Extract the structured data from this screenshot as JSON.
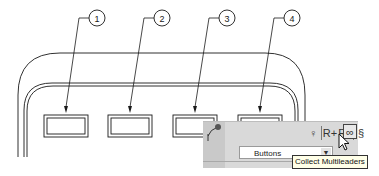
{
  "balloons": [
    {
      "label": "1",
      "cx": 97,
      "cy": 18,
      "leader_to": [
        66,
        113
      ]
    },
    {
      "label": "2",
      "cx": 162,
      "cy": 18,
      "leader_to": [
        130,
        113
      ]
    },
    {
      "label": "3",
      "cx": 227,
      "cy": 18,
      "leader_to": [
        195,
        113
      ]
    },
    {
      "label": "4",
      "cx": 292,
      "cy": 18,
      "leader_to": [
        260,
        113
      ]
    }
  ],
  "toolbar": {
    "tools": [
      {
        "name": "add-leader-tool",
        "glyph": "♀"
      },
      {
        "name": "add-leader-plus-tool",
        "glyph": "R+"
      },
      {
        "name": "remove-leader-tool",
        "glyph": "Rx"
      },
      {
        "name": "align-multileaders-tool",
        "glyph": "§"
      },
      {
        "name": "collect-multileaders-tool",
        "glyph": "∞"
      }
    ],
    "style_combo": {
      "value": "Buttons"
    },
    "tooltip": "Collect Multileaders"
  },
  "colors": {
    "line": "#1a1a1a",
    "panel": "#d9d9d9",
    "tooltip_bg": "#ffffe8"
  }
}
